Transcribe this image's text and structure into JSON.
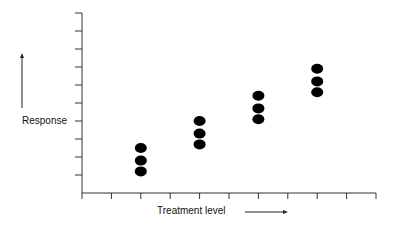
{
  "chart_data": {
    "type": "scatter",
    "title": "",
    "xlabel": "Treatment level",
    "ylabel": "Response",
    "x_ticks": 10,
    "y_ticks": 10,
    "xlim": [
      0,
      10
    ],
    "ylim": [
      0,
      10
    ],
    "grid": false,
    "legend": null,
    "tick_labels_shown": false,
    "series": [
      {
        "name": "responses",
        "points": [
          {
            "x": 2,
            "y": 2.5
          },
          {
            "x": 2,
            "y": 1.8
          },
          {
            "x": 2,
            "y": 1.2
          },
          {
            "x": 4,
            "y": 4.0
          },
          {
            "x": 4,
            "y": 3.3
          },
          {
            "x": 4,
            "y": 2.7
          },
          {
            "x": 6,
            "y": 5.4
          },
          {
            "x": 6,
            "y": 4.7
          },
          {
            "x": 6,
            "y": 4.1
          },
          {
            "x": 8,
            "y": 6.9
          },
          {
            "x": 8,
            "y": 6.2
          },
          {
            "x": 8,
            "y": 5.6
          }
        ]
      }
    ],
    "annotations": [
      {
        "type": "arrow",
        "direction": "up",
        "near": "ylabel"
      },
      {
        "type": "arrow",
        "direction": "right",
        "near": "xlabel"
      }
    ]
  },
  "labels": {
    "y_axis": "Response",
    "x_axis": "Treatment level"
  },
  "colors": {
    "axis": "#333333",
    "marker": "#000000",
    "background": "#ffffff"
  }
}
